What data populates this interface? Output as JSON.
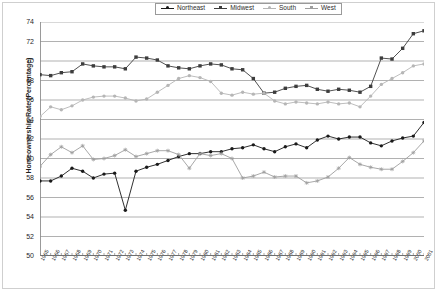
{
  "chart_data": {
    "type": "line",
    "title": "",
    "xlabel": "",
    "ylabel": "Homeownership Rate (Percentage)",
    "ylim": [
      50,
      74
    ],
    "ytick_step": 2,
    "yticks": [
      50,
      52,
      54,
      56,
      58,
      60,
      62,
      64,
      66,
      68,
      70,
      72,
      74
    ],
    "grid": true,
    "legend_position": "top-center",
    "categories": [
      "1965",
      "1966",
      "1967",
      "1968",
      "1969",
      "1970",
      "1971",
      "1972",
      "1973",
      "1974",
      "1975",
      "1976",
      "1977",
      "1978",
      "1979",
      "1980",
      "1981",
      "1982",
      "1983",
      "1984",
      "1985",
      "1986",
      "1987",
      "1988",
      "1989",
      "1990",
      "1991",
      "1992",
      "1993",
      "1994",
      "1995",
      "1996",
      "1997",
      "1998",
      "1999",
      "2000",
      "2001"
    ],
    "series": [
      {
        "name": "Northeast",
        "color": "#1a1a1a",
        "marker": "circle",
        "values": [
          57.7,
          57.7,
          58.2,
          59.0,
          58.7,
          58.0,
          58.4,
          58.5,
          54.7,
          58.7,
          59.1,
          59.4,
          59.8,
          60.2,
          60.5,
          60.5,
          60.7,
          60.7,
          61.0,
          61.1,
          61.4,
          61.0,
          60.7,
          61.2,
          61.5,
          61.1,
          61.9,
          62.3,
          62.0,
          62.2,
          62.2,
          61.6,
          61.3,
          61.8,
          62.1,
          62.3,
          63.7
        ]
      },
      {
        "name": "Midwest",
        "color": "#3d3d3d",
        "marker": "square",
        "values": [
          68.6,
          68.5,
          68.8,
          68.9,
          69.7,
          69.5,
          69.4,
          69.4,
          69.2,
          70.4,
          70.3,
          70.1,
          69.5,
          69.3,
          69.2,
          69.5,
          69.7,
          69.6,
          69.2,
          69.1,
          68.2,
          66.7,
          66.8,
          67.2,
          67.4,
          67.5,
          67.1,
          66.9,
          67.1,
          67.0,
          66.8,
          67.4,
          70.3,
          70.2,
          71.3,
          72.8,
          73.1
        ]
      },
      {
        "name": "South",
        "color": "#b6b6b6",
        "marker": "circle",
        "values": [
          64.3,
          65.3,
          65.0,
          65.4,
          66.0,
          66.3,
          66.4,
          66.4,
          66.2,
          65.9,
          66.1,
          66.8,
          67.5,
          68.2,
          68.5,
          68.3,
          67.9,
          66.7,
          66.5,
          66.8,
          66.6,
          66.7,
          65.9,
          65.6,
          65.8,
          65.7,
          65.6,
          65.8,
          65.6,
          65.7,
          65.3,
          66.4,
          67.6,
          68.2,
          68.8,
          69.5,
          69.7
        ]
      },
      {
        "name": "West",
        "color": "#9e9e9e",
        "marker": "star",
        "values": [
          59.2,
          60.4,
          61.2,
          60.6,
          61.3,
          59.9,
          60.0,
          60.3,
          60.9,
          60.2,
          60.5,
          60.8,
          60.8,
          60.4,
          59.0,
          60.5,
          60.3,
          60.5,
          60.0,
          58.0,
          58.2,
          58.6,
          58.1,
          58.2,
          58.2,
          57.5,
          57.7,
          58.1,
          59.0,
          60.1,
          59.4,
          59.1,
          58.9,
          58.9,
          59.7,
          60.6,
          61.8
        ]
      }
    ]
  },
  "legend": {
    "items": [
      {
        "label": "Northeast"
      },
      {
        "label": "Midwest"
      },
      {
        "label": "South"
      },
      {
        "label": "West"
      }
    ]
  }
}
